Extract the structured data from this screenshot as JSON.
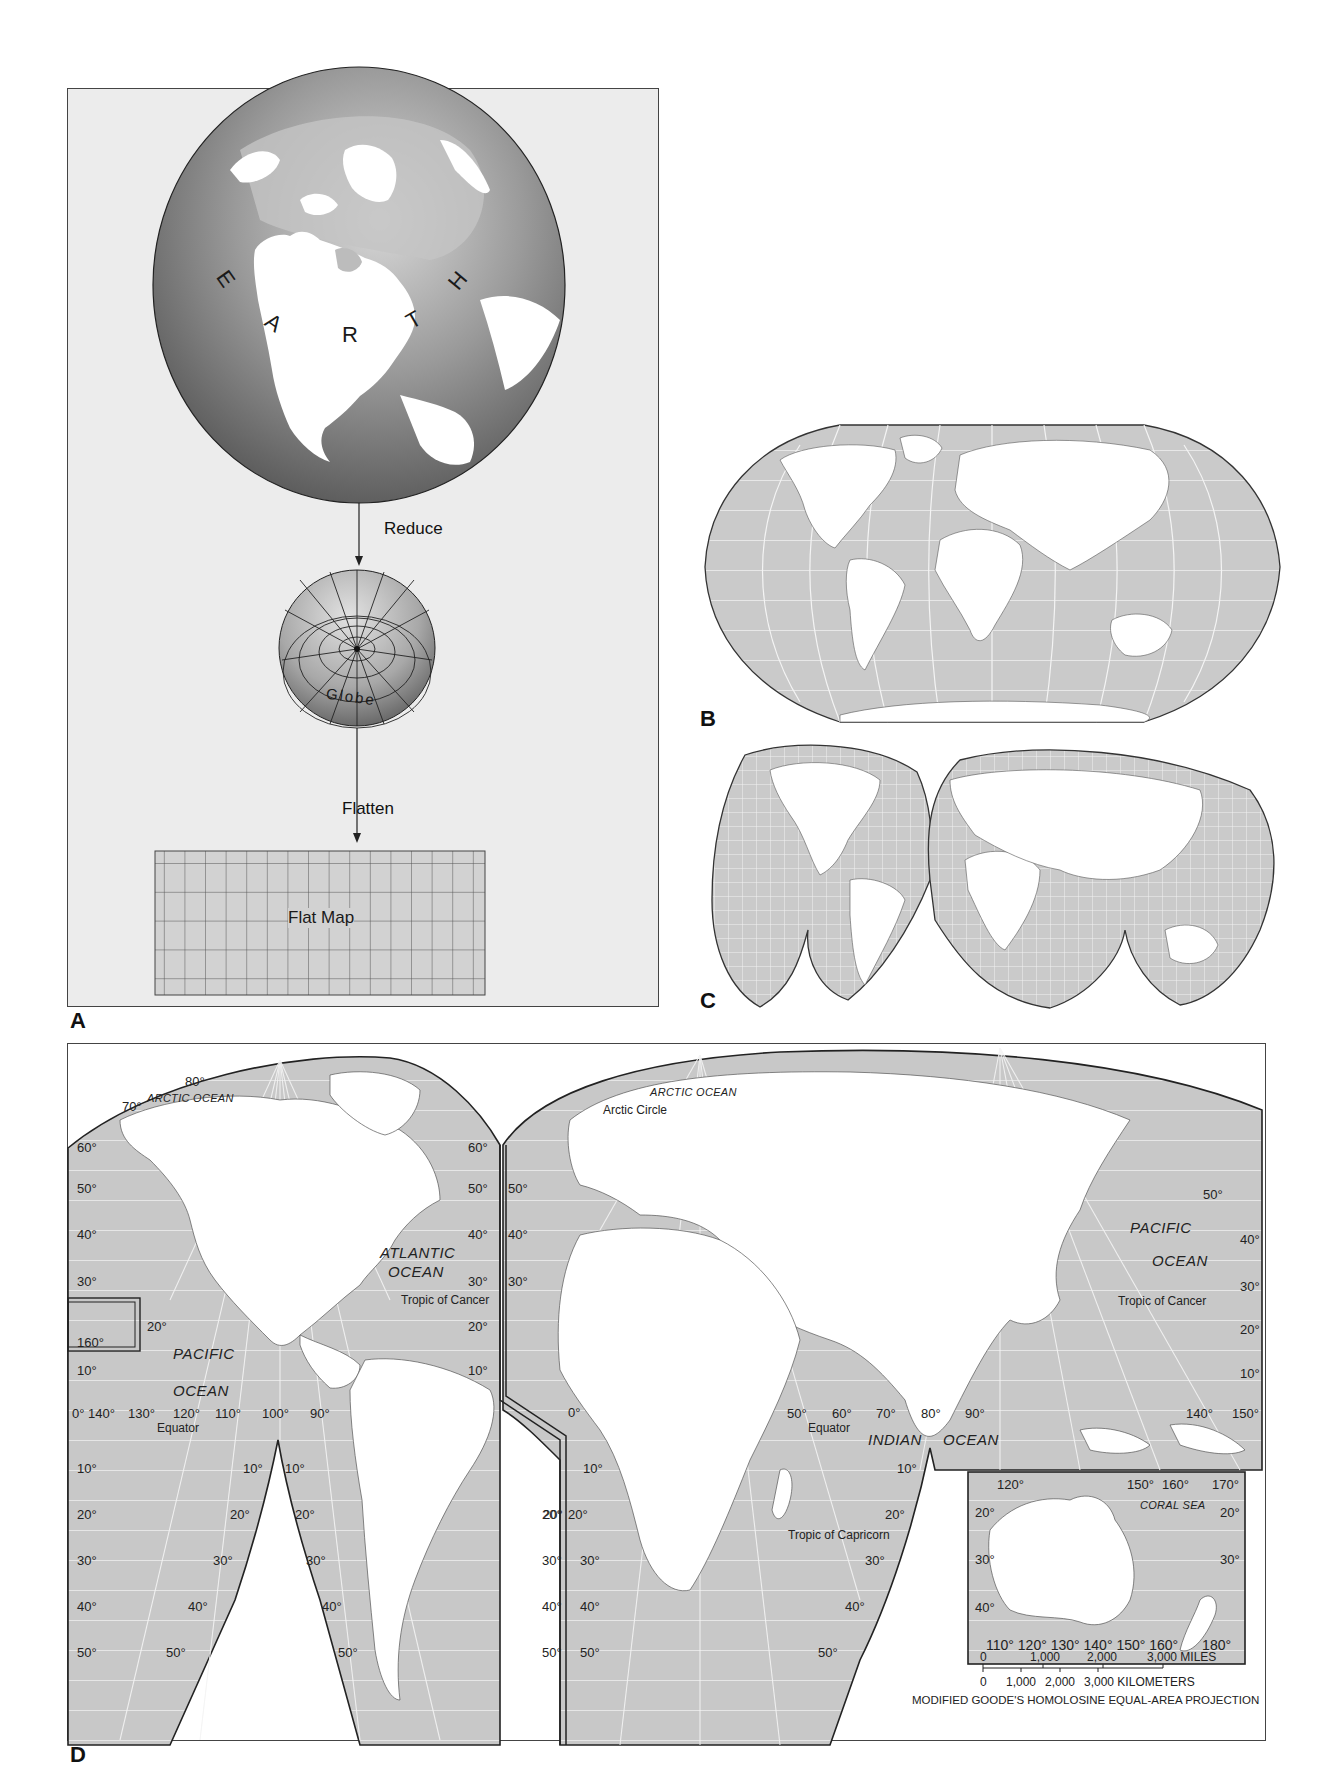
{
  "panels": {
    "A": {
      "letter": "A",
      "earth_letters": [
        "E",
        "A",
        "R",
        "T",
        "H"
      ],
      "reduce_label": "Reduce",
      "globe_label": "Globe",
      "flatten_label": "Flatten",
      "flat_map_label": "Flat Map",
      "flat_map_grid": {
        "columns": 16,
        "rows": 5
      }
    },
    "B": {
      "letter": "B",
      "projection": "Robinson-style world map"
    },
    "C": {
      "letter": "C",
      "projection": "Interrupted Goode world map"
    },
    "D": {
      "letter": "D",
      "oceans": {
        "arctic_west": "ARCTIC OCEAN",
        "arctic_east": "ARCTIC OCEAN",
        "atlantic_1": "ATLANTIC",
        "atlantic_2": "OCEAN",
        "pacific_west_1": "PACIFIC",
        "pacific_west_2": "OCEAN",
        "pacific_east_1": "PACIFIC",
        "pacific_east_2": "OCEAN",
        "indian_1": "INDIAN",
        "indian_2": "OCEAN",
        "coral_sea": "CORAL  SEA"
      },
      "lines": {
        "arctic_circle": "Arctic Circle",
        "tropic_cancer_west": "Tropic of Cancer",
        "tropic_cancer_east": "Tropic of Cancer",
        "tropic_capricorn": "Tropic of Capricorn",
        "equator_west": "Equator",
        "equator_east": "Equator"
      },
      "west_lobe_lat_left": [
        "60°",
        "50°",
        "40°",
        "30°",
        "20°",
        "10°",
        "0°",
        "10°",
        "20°",
        "30°",
        "40°",
        "50°"
      ],
      "west_lobe_lat_right": [
        "60°",
        "50°",
        "40°",
        "30°",
        "20°",
        "10°"
      ],
      "west_top_labels": [
        "80°",
        "70°"
      ],
      "hawaii_inset_label": "160°",
      "west_lon_labels": [
        "140°",
        "130°",
        "120°",
        "110°",
        "100°",
        "90°"
      ],
      "west_gap_left": [
        "10°",
        "20°",
        "30°",
        "40°",
        "50°"
      ],
      "west_gap_right": [
        "10°",
        "20°",
        "30°",
        "40°",
        "50°"
      ],
      "sa_lobe_right": [
        "20°",
        "30°",
        "40°",
        "50°"
      ],
      "east_lat_left": [
        "50°",
        "40°",
        "30°",
        "20°",
        "30°",
        "40°",
        "50°"
      ],
      "east_zero": "0°",
      "east_africa_lat": [
        "10°",
        "20°"
      ],
      "east_indian_lon": [
        "50°",
        "60°",
        "70°",
        "80°",
        "90°"
      ],
      "east_indian_lat_right": [
        "10°",
        "20°",
        "30°",
        "40°",
        "50°"
      ],
      "east_asia_lon": [
        "140°",
        "150°"
      ],
      "east_asia_lat_right": [
        "50°",
        "40°",
        "30°",
        "20°",
        "10°"
      ],
      "australia_inset": {
        "top_lon": [
          "120°",
          "150°",
          "160°",
          "170°"
        ],
        "lat_left": [
          "20°",
          "30°",
          "40°"
        ],
        "lat_right": [
          "20°",
          "30°"
        ],
        "bottom_lon": [
          "110°",
          "120°",
          "130°",
          "140°",
          "150°",
          "160°",
          "180°"
        ]
      },
      "scale_bar": {
        "miles_ticks": [
          "0",
          "1,000",
          "2,000",
          "3,000 MILES"
        ],
        "km_ticks": [
          "0",
          "1,000",
          "2,000",
          "3,000 KILOMETERS"
        ]
      },
      "projection_caption": "MODIFIED GOODE'S HOMOLOSINE EQUAL-AREA PROJECTION"
    }
  },
  "colors": {
    "ocean_fill": "#c9c9c9",
    "land_fill": "#ffffff",
    "globe_dark": "#6e6e6e",
    "globe_light": "#d6d6d6",
    "panel_a_bg": "#ececec",
    "border": "#333333",
    "graticule": "#f2f2f2"
  }
}
